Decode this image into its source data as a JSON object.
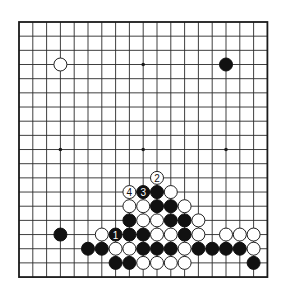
{
  "board": {
    "size": 19,
    "origin_x": 19,
    "origin_y": 22,
    "step_x": 13.8,
    "step_y": 14.17,
    "stone_radius": 6.5,
    "colors": {
      "line": "#2a2a2a",
      "black": "#111111",
      "white": "#ffffff",
      "background": "#ffffff"
    },
    "hoshi": [
      [
        3,
        3
      ],
      [
        9,
        3
      ],
      [
        15,
        3
      ],
      [
        3,
        9
      ],
      [
        9,
        9
      ],
      [
        15,
        9
      ],
      [
        3,
        15
      ],
      [
        9,
        15
      ],
      [
        15,
        15
      ]
    ],
    "stones": [
      {
        "color": "white",
        "col": 3,
        "row": 3
      },
      {
        "color": "black",
        "col": 15,
        "row": 3
      },
      {
        "color": "black",
        "col": 3,
        "row": 15
      },
      {
        "color": "white",
        "col": 10,
        "row": 11,
        "label": "2"
      },
      {
        "color": "white",
        "col": 8,
        "row": 12,
        "label": "4"
      },
      {
        "color": "black",
        "col": 9,
        "row": 12,
        "label": "3"
      },
      {
        "color": "black",
        "col": 10,
        "row": 12
      },
      {
        "color": "white",
        "col": 11,
        "row": 12
      },
      {
        "color": "white",
        "col": 8,
        "row": 13
      },
      {
        "color": "white",
        "col": 9,
        "row": 13
      },
      {
        "color": "black",
        "col": 10,
        "row": 13
      },
      {
        "color": "black",
        "col": 11,
        "row": 13
      },
      {
        "color": "white",
        "col": 12,
        "row": 13
      },
      {
        "color": "black",
        "col": 8,
        "row": 14
      },
      {
        "color": "white",
        "col": 9,
        "row": 14
      },
      {
        "color": "white",
        "col": 10,
        "row": 14
      },
      {
        "color": "black",
        "col": 11,
        "row": 14
      },
      {
        "color": "black",
        "col": 12,
        "row": 14
      },
      {
        "color": "white",
        "col": 13,
        "row": 14
      },
      {
        "color": "white",
        "col": 6,
        "row": 15
      },
      {
        "color": "black",
        "col": 7,
        "row": 15,
        "label": "1"
      },
      {
        "color": "black",
        "col": 8,
        "row": 15
      },
      {
        "color": "black",
        "col": 9,
        "row": 15
      },
      {
        "color": "white",
        "col": 10,
        "row": 15
      },
      {
        "color": "white",
        "col": 11,
        "row": 15
      },
      {
        "color": "black",
        "col": 12,
        "row": 15
      },
      {
        "color": "white",
        "col": 13,
        "row": 15
      },
      {
        "color": "white",
        "col": 15,
        "row": 15
      },
      {
        "color": "white",
        "col": 16,
        "row": 15
      },
      {
        "color": "white",
        "col": 17,
        "row": 15
      },
      {
        "color": "black",
        "col": 5,
        "row": 16
      },
      {
        "color": "black",
        "col": 6,
        "row": 16
      },
      {
        "color": "white",
        "col": 7,
        "row": 16
      },
      {
        "color": "white",
        "col": 8,
        "row": 16
      },
      {
        "color": "black",
        "col": 9,
        "row": 16
      },
      {
        "color": "black",
        "col": 10,
        "row": 16
      },
      {
        "color": "black",
        "col": 11,
        "row": 16
      },
      {
        "color": "white",
        "col": 12,
        "row": 16
      },
      {
        "color": "black",
        "col": 13,
        "row": 16
      },
      {
        "color": "black",
        "col": 14,
        "row": 16
      },
      {
        "color": "black",
        "col": 15,
        "row": 16
      },
      {
        "color": "black",
        "col": 16,
        "row": 16
      },
      {
        "color": "white",
        "col": 17,
        "row": 16
      },
      {
        "color": "black",
        "col": 7,
        "row": 17
      },
      {
        "color": "black",
        "col": 8,
        "row": 17
      },
      {
        "color": "white",
        "col": 9,
        "row": 17
      },
      {
        "color": "white",
        "col": 10,
        "row": 17
      },
      {
        "color": "white",
        "col": 11,
        "row": 17
      },
      {
        "color": "white",
        "col": 12,
        "row": 17
      },
      {
        "color": "black",
        "col": 17,
        "row": 17
      }
    ]
  }
}
